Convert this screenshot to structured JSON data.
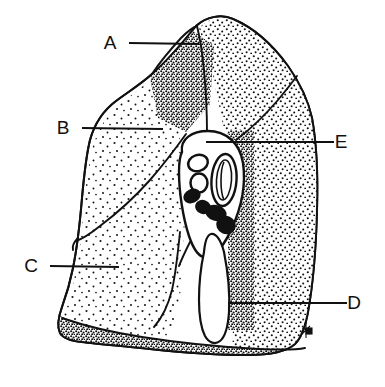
{
  "figure": {
    "background_color": "#ffffff",
    "ink_color": "#111111",
    "width": 385,
    "height": 387
  },
  "labels": [
    {
      "id": "A",
      "text": "A",
      "text_x": 110,
      "text_y": 49,
      "line_x1": 129,
      "line_y1": 43,
      "line_x2": 199,
      "line_y2": 44
    },
    {
      "id": "B",
      "text": "B",
      "text_x": 63,
      "text_y": 134,
      "line_x1": 82,
      "line_y1": 128,
      "line_x2": 163,
      "line_y2": 129
    },
    {
      "id": "C",
      "text": "C",
      "text_x": 31,
      "text_y": 272,
      "line_x1": 50,
      "line_y1": 266,
      "line_x2": 119,
      "line_y2": 267
    },
    {
      "id": "D",
      "text": "D",
      "text_x": 354,
      "text_y": 309,
      "line_x1": 228,
      "line_y1": 303,
      "line_x2": 347,
      "line_y2": 303
    },
    {
      "id": "E",
      "text": "E",
      "text_x": 341,
      "text_y": 148,
      "line_x1": 206,
      "line_y1": 142,
      "line_x2": 334,
      "line_y2": 142
    }
  ],
  "artist_mark": {
    "present": true,
    "x": 305,
    "y": 330
  },
  "hilum": {
    "vessel_rings": [
      {
        "cx": 198,
        "cy": 163,
        "rx": 10,
        "ry": 8,
        "rotation": -18
      },
      {
        "cx": 199,
        "cy": 183,
        "rx": 8.5,
        "ry": 9.5,
        "rotation": 0
      }
    ],
    "bronchus": {
      "cx": 224,
      "cy": 180,
      "rx": 12,
      "ry": 26
    },
    "lymph_nodes": [
      {
        "cx": 192,
        "cy": 196,
        "rx": 9,
        "ry": 7,
        "rotation": -25
      },
      {
        "cx": 203,
        "cy": 207,
        "rx": 8,
        "ry": 7,
        "rotation": 20
      },
      {
        "cx": 216,
        "cy": 213,
        "rx": 11,
        "ry": 8,
        "rotation": 18
      },
      {
        "cx": 226,
        "cy": 225,
        "rx": 10,
        "ry": 9,
        "rotation": 25
      }
    ]
  }
}
